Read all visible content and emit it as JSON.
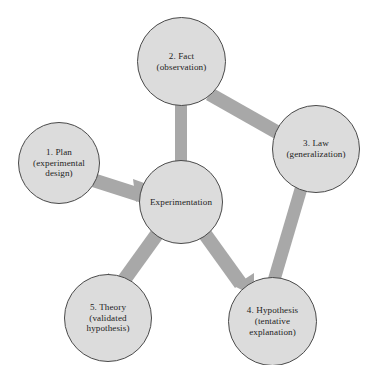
{
  "diagram": {
    "type": "cycle-diagram",
    "colors": {
      "node_fill": "#dcdcdc",
      "node_stroke": "#4a4a4a",
      "arrow": "#a8a8a8",
      "text": "#1c1c1c",
      "background": "#ffffff"
    },
    "nodes": [
      {
        "id": "plan",
        "label": "1.  Plan\n(experimental\ndesign)",
        "number": "1",
        "name": "Plan",
        "detail": "experimental design"
      },
      {
        "id": "fact",
        "label": "2.  Fact\n(observation)",
        "number": "2",
        "name": "Fact",
        "detail": "observation"
      },
      {
        "id": "law",
        "label": "3.  Law\n(generalization)",
        "number": "3",
        "name": "Law",
        "detail": "generalization"
      },
      {
        "id": "hypothesis",
        "label": "4.  Hypothesis\n(tentative\nexplanation)",
        "number": "4",
        "name": "Hypothesis",
        "detail": "tentative explanation"
      },
      {
        "id": "theory",
        "label": "5.  Theory\n(validated\nhypothesis)",
        "number": "5",
        "name": "Theory",
        "detail": "validated hypothesis"
      },
      {
        "id": "experimentation",
        "label": "Experimentation",
        "number": "",
        "name": "Experimentation",
        "detail": ""
      }
    ],
    "edges": [
      {
        "id": "plan-to-experimentation",
        "from": "plan",
        "to": "experimentation",
        "label": ""
      },
      {
        "id": "experimentation-to-fact",
        "from": "experimentation",
        "to": "fact",
        "label": ""
      },
      {
        "id": "fact-to-law",
        "from": "fact",
        "to": "law",
        "label": ""
      },
      {
        "id": "law-to-hypothesis",
        "from": "law",
        "to": "hypothesis",
        "label": ""
      },
      {
        "id": "experimentation-to-hypothesis",
        "from": "experimentation",
        "to": "hypothesis",
        "label": ""
      },
      {
        "id": "experimentation-to-theory",
        "from": "experimentation",
        "to": "theory",
        "label": ""
      }
    ]
  }
}
